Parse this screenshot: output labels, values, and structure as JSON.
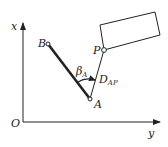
{
  "diagram": {
    "axes": {
      "vertical_label": "x",
      "horizontal_label": "y",
      "origin_label": "O"
    },
    "points": {
      "A": "A",
      "B": "B",
      "P": "P"
    },
    "angle_label": {
      "symbol": "β",
      "subscript": "A"
    },
    "distance_label": {
      "symbol": "D",
      "subscript": "AP"
    },
    "colors": {
      "line": "#222222",
      "background": "#ffffff"
    }
  }
}
